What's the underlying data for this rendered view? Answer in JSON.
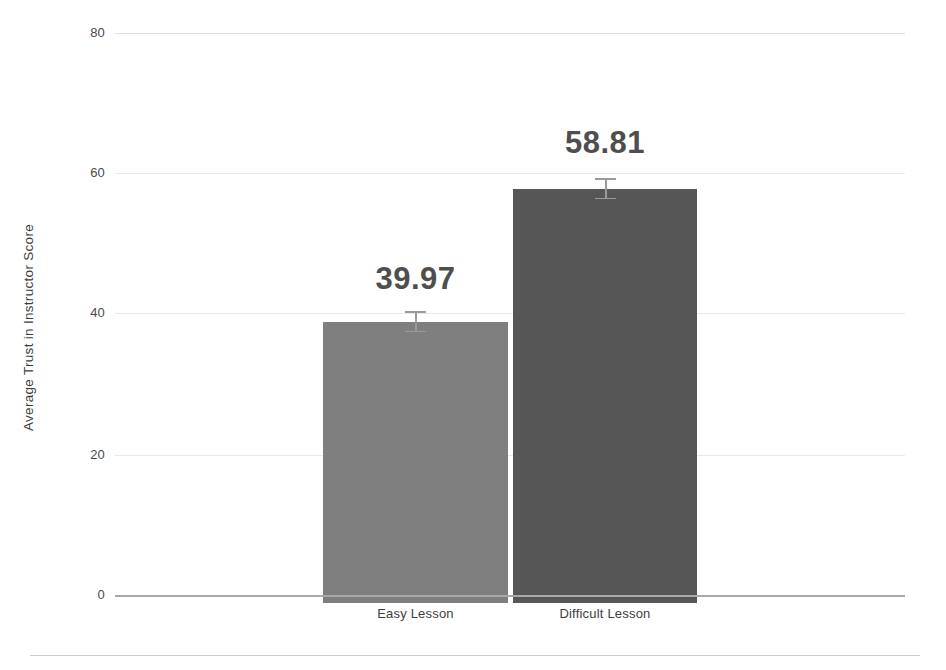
{
  "chart_data": {
    "type": "bar",
    "title": "",
    "xlabel": "",
    "ylabel": "Average Trust in Instructor Score",
    "categories": [
      "Easy Lesson",
      "Difficult Lesson"
    ],
    "values": [
      39.97,
      58.81
    ],
    "value_labels": [
      "39.97",
      "58.81"
    ],
    "errors": [
      1.5,
      1.5
    ],
    "ylim": [
      0,
      80
    ],
    "yticks": [
      0,
      20,
      40,
      60,
      80
    ],
    "ytick_labels": [
      "0",
      "20",
      "40",
      "60",
      "80"
    ],
    "grid": true,
    "legend": "none",
    "bar_colors": [
      "#808080",
      "#545454"
    ],
    "error_bar_color": "#9a9a9a",
    "label_color": "#4e4e4e",
    "axis_color": "#a9a9a9",
    "gridline_color": "#e9e9e9"
  },
  "axis": {
    "y_title": "Average Trust in Instructor Score",
    "ticks": {
      "t80": "80",
      "t60": "60",
      "t40": "40",
      "t20": "20",
      "t0": "0"
    }
  },
  "bars": [
    {
      "category": "Easy Lesson",
      "value_label": "39.97"
    },
    {
      "category": "Difficult Lesson",
      "value_label": "58.81"
    }
  ]
}
